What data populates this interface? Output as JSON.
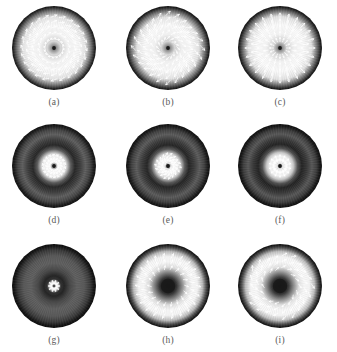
{
  "figure": {
    "background_color": "#ffffff",
    "caption_color": "#5a5a5a",
    "rows": 3,
    "columns": 3
  },
  "panels": [
    {
      "id": "a",
      "caption": "(a)",
      "field_type": "spiral-vortex",
      "arrow_color": "#ffffff",
      "center_spot": "dark",
      "edge_ring": "dark",
      "interior": "bright",
      "rings": 5,
      "arrows_per_ring": 16,
      "swirl_angle_deg": 70,
      "polygon_sides": 0
    },
    {
      "id": "b",
      "caption": "(b)",
      "field_type": "square-swirl-vortex",
      "arrow_color": "#ffffff",
      "center_spot": "dark",
      "edge_ring": "dark",
      "interior": "bright",
      "rings": 5,
      "arrows_per_ring": 16,
      "swirl_angle_deg": 45,
      "polygon_sides": 4
    },
    {
      "id": "c",
      "caption": "(c)",
      "field_type": "radial",
      "arrow_color": "#ffffff",
      "center_spot": "dark",
      "edge_ring": "dark",
      "interior": "bright",
      "rings": 5,
      "arrows_per_ring": 16,
      "swirl_angle_deg": 0,
      "polygon_sides": 0
    },
    {
      "id": "d",
      "caption": "(d)",
      "field_type": "spiral-core",
      "arrow_color": "#ffffff",
      "center_spot": "dark",
      "edge_ring": "dark",
      "interior": "annular-dark",
      "rings": 3,
      "arrows_per_ring": 14,
      "swirl_angle_deg": 70,
      "polygon_sides": 0
    },
    {
      "id": "e",
      "caption": "(e)",
      "field_type": "square-swirl-core",
      "arrow_color": "#ffffff",
      "center_spot": "dark",
      "edge_ring": "dark",
      "interior": "annular-dark",
      "rings": 3,
      "arrows_per_ring": 14,
      "swirl_angle_deg": 45,
      "polygon_sides": 4
    },
    {
      "id": "f",
      "caption": "(f)",
      "field_type": "radial-core",
      "arrow_color": "#ffffff",
      "center_spot": "dark",
      "edge_ring": "dark",
      "interior": "annular-dark",
      "rings": 2,
      "arrows_per_ring": 12,
      "swirl_angle_deg": 0,
      "polygon_sides": 0
    },
    {
      "id": "g",
      "caption": "(g)",
      "field_type": "radial-small-core",
      "arrow_color": "#ffffff",
      "center_spot": "bright",
      "edge_ring": "dark",
      "interior": "dark",
      "rings": 1,
      "arrows_per_ring": 10,
      "swirl_angle_deg": 0,
      "polygon_sides": 0
    },
    {
      "id": "h",
      "caption": "(h)",
      "field_type": "annular-radial",
      "arrow_color": "#ffffff",
      "center_spot": "dark-large",
      "edge_ring": "dark",
      "interior": "bright-annulus",
      "rings": 3,
      "arrows_per_ring": 18,
      "swirl_angle_deg": 20,
      "polygon_sides": 0
    },
    {
      "id": "i",
      "caption": "(i)",
      "field_type": "annular-pentagon-swirl",
      "arrow_color": "#ffffff",
      "center_spot": "dark-large",
      "edge_ring": "dark",
      "interior": "bright-annulus",
      "rings": 3,
      "arrows_per_ring": 18,
      "swirl_angle_deg": 55,
      "polygon_sides": 5
    }
  ]
}
